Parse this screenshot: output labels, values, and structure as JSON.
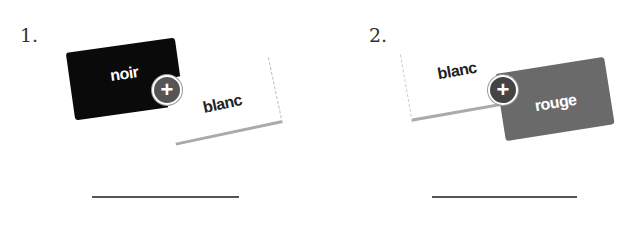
{
  "exercises": [
    {
      "number": "1.",
      "left": {
        "label": "noir",
        "color": "#0a0a0a",
        "text_color": "#ffffff"
      },
      "right": {
        "label": "blanc",
        "color": "#ffffff",
        "text_color": "#222222"
      },
      "operator": "+",
      "answer": ""
    },
    {
      "number": "2.",
      "left": {
        "label": "blanc",
        "color": "#ffffff",
        "text_color": "#222222"
      },
      "right": {
        "label": "rouge",
        "color": "#6a6a6a",
        "text_color": "#ffffff"
      },
      "operator": "+",
      "answer": ""
    }
  ],
  "colors": {
    "plus_circle": "#555555",
    "blank_line": "#555555"
  }
}
